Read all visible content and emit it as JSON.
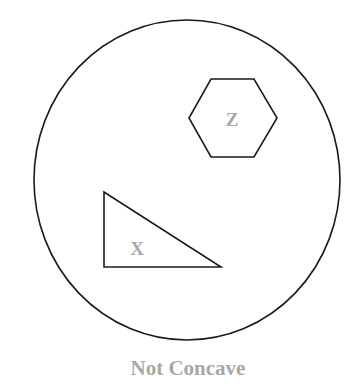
{
  "diagram": {
    "container": {
      "shape": "circle",
      "cx": 187,
      "cy": 180,
      "rx": 153,
      "ry": 160,
      "stroke": "#1a1a1a"
    },
    "shapes": [
      {
        "id": "Z",
        "type": "hexagon",
        "label": "Z",
        "points": "211,79 254,79 277,118 254,157 211,157 189,118",
        "label_x": 232,
        "label_y": 126
      },
      {
        "id": "X",
        "type": "right-triangle",
        "label": "X",
        "points": "104,192 104,267 221,267",
        "label_x": 137,
        "label_y": 255
      }
    ],
    "caption": "Not Concave",
    "label_color": "#a8a8a8",
    "stroke_color": "#1a1a1a"
  }
}
